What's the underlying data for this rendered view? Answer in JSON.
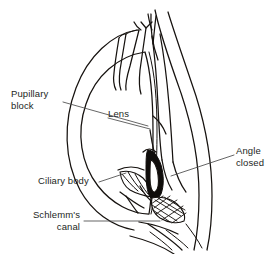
{
  "figure": {
    "name": "angle-closure-glaucoma-cross-section",
    "background_color": "#ffffff",
    "line_color": "#16120f",
    "label_color": "#231f1c",
    "leader_color": "#4a4a4a"
  },
  "labels": {
    "pupillary_block": "Pupillary\nblock",
    "lens": "Lens",
    "angle_closed": "Angle\nclosed",
    "ciliary_body": "Ciliary body",
    "schlemms_canal": "Schlemm's\ncanal"
  },
  "structures": [
    {
      "id": "lens",
      "label": "Lens"
    },
    {
      "id": "iris",
      "label": "Iris"
    },
    {
      "id": "cornea",
      "label": "Cornea"
    },
    {
      "id": "ciliary-body",
      "label": "Ciliary body"
    },
    {
      "id": "schlemms-canal",
      "label": "Schlemm's canal"
    },
    {
      "id": "angle-closed",
      "label": "Angle closed"
    },
    {
      "id": "pupillary-block",
      "label": "Pupillary block"
    }
  ]
}
